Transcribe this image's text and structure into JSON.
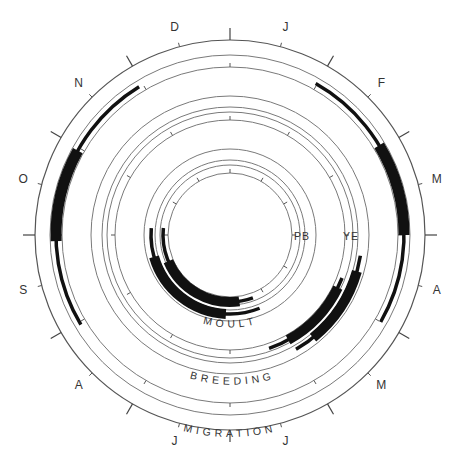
{
  "diagram": {
    "center": [
      230,
      235
    ],
    "months": [
      {
        "label": "J",
        "angle": 15
      },
      {
        "label": "F",
        "angle": 45
      },
      {
        "label": "M",
        "angle": 75
      },
      {
        "label": "A",
        "angle": 105
      },
      {
        "label": "M",
        "angle": 135
      },
      {
        "label": "J",
        "angle": 165
      },
      {
        "label": "J",
        "angle": 195
      },
      {
        "label": "A",
        "angle": 225
      },
      {
        "label": "S",
        "angle": 255
      },
      {
        "label": "O",
        "angle": 285
      },
      {
        "label": "N",
        "angle": 315
      },
      {
        "label": "D",
        "angle": 345
      }
    ],
    "rings": {
      "migration": {
        "label": "MIGRATION",
        "radii": [
          195,
          180,
          168
        ]
      },
      "breeding": {
        "label": "BREEDING",
        "radii": [
          139,
          128,
          123,
          115
        ]
      },
      "moult": {
        "label": "MOULT",
        "radii": [
          86,
          75,
          70,
          62
        ]
      }
    },
    "group_labels": [
      {
        "label": "PB",
        "x": 302,
        "y": 237
      },
      {
        "label": "YE",
        "x": 351,
        "y": 237
      }
    ],
    "bars": {
      "migration": [
        {
          "name": "autumn-migration",
          "radius": 174,
          "thin": [
            239,
            328.5
          ],
          "thick": [
            268,
            299
          ]
        },
        {
          "name": "spring-migration",
          "radius": 174,
          "thin": [
            29.5,
            120
          ],
          "thick": [
            59,
            90
          ]
        }
      ],
      "breeding": [
        {
          "name": "breeding-ye-outer",
          "radius": 132,
          "thin": [
            99,
            150
          ],
          "thick": [
            106,
            141
          ]
        },
        {
          "name": "breeding-pb-inner",
          "radius": 120,
          "thin": [
            111,
            161
          ],
          "thick": [
            116,
            151
          ]
        }
      ],
      "moult": [
        {
          "name": "moult-outer",
          "radius": 79,
          "thin": [
            158,
            275
          ],
          "thick": [
            183,
            254
          ]
        },
        {
          "name": "moult-inner",
          "radius": 67,
          "thin": [
            160,
            276
          ],
          "thick": [
            172,
            247
          ]
        }
      ]
    }
  }
}
